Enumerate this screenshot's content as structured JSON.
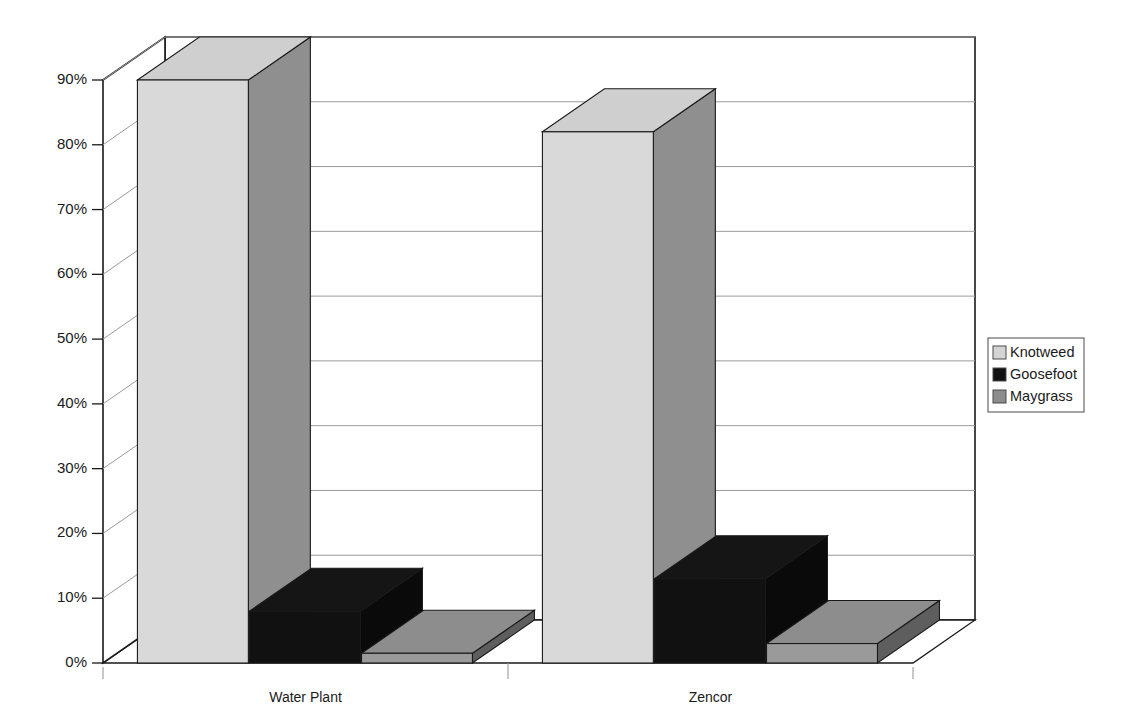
{
  "chart_data": {
    "type": "bar",
    "title": "",
    "subtitle": "",
    "xlabel": "",
    "ylabel": "",
    "categories": [
      "Water Plant",
      "Zencor"
    ],
    "series": [
      {
        "name": "Knotweed",
        "values": [
          90,
          82
        ],
        "color": "#d4d4d4"
      },
      {
        "name": "Goosefoot",
        "values": [
          8,
          13
        ],
        "color": "#111111"
      },
      {
        "name": "Maygrass",
        "values": [
          1.5,
          3
        ],
        "color": "#8c8c8c"
      }
    ],
    "ylim": [
      0,
      90
    ],
    "ytick_values": [
      0,
      10,
      20,
      30,
      40,
      50,
      60,
      70,
      80,
      90
    ],
    "ytick_labels": [
      "0%",
      "10%",
      "20%",
      "30%",
      "40%",
      "50%",
      "60%",
      "70%",
      "80%",
      "90%"
    ],
    "grid": true,
    "three_d": true,
    "legend_position": "right",
    "legend_entries": [
      {
        "label": "Knotweed",
        "swatch": "#d4d4d4"
      },
      {
        "label": "Goosefoot",
        "swatch": "#111111"
      },
      {
        "label": "Maygrass",
        "swatch": "#8c8c8c"
      }
    ]
  },
  "axis": {
    "tick_0": "0%",
    "tick_1": "10%",
    "tick_2": "20%",
    "tick_3": "30%",
    "tick_4": "40%",
    "tick_5": "50%",
    "tick_6": "60%",
    "tick_7": "70%",
    "tick_8": "80%",
    "tick_9": "90%"
  },
  "categories": {
    "cat_0": "Water Plant",
    "cat_1": "Zencor"
  },
  "legend": {
    "item_0": "Knotweed",
    "item_1": "Goosefoot",
    "item_2": "Maygrass"
  },
  "colors": {
    "knotweed_front": "#d9d9d9",
    "knotweed_side": "#8f8f8f",
    "knotweed_top": "#cfcfcf",
    "goosefoot_front": "#111111",
    "goosefoot_side": "#0a0a0a",
    "goosefoot_top": "#151515",
    "maygrass_front": "#9a9a9a",
    "maygrass_side": "#5e5e5e",
    "maygrass_top": "#8d8d8d",
    "axis_line": "#1a1a1a",
    "grid_line": "#9a9a9a",
    "background": "#ffffff"
  }
}
